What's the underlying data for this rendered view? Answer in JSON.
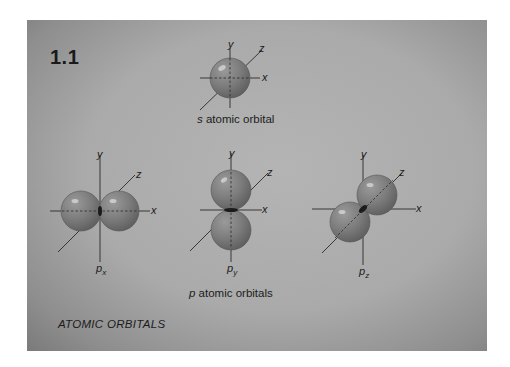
{
  "figure": {
    "number": "1.1",
    "title": "ATOMIC ORBITALS",
    "colors": {
      "background": "#ffffff",
      "panel": "#aaaaaa",
      "lobe": "#7e7e7e",
      "text": "#1c1c1c"
    }
  },
  "s_orbital": {
    "caption_letter": "s",
    "caption_rest": " atomic orbital",
    "axes": {
      "x": "x",
      "y": "y",
      "z": "z"
    }
  },
  "p_orbitals": {
    "caption_letter": "p",
    "caption_rest": " atomic orbitals",
    "items": [
      {
        "name": "p",
        "subscript": "x",
        "axes": {
          "x": "x",
          "y": "y",
          "z": "z"
        }
      },
      {
        "name": "p",
        "subscript": "y",
        "axes": {
          "x": "x",
          "y": "y",
          "z": "z"
        }
      },
      {
        "name": "p",
        "subscript": "z",
        "axes": {
          "x": "x",
          "y": "y",
          "z": "z"
        }
      }
    ]
  }
}
